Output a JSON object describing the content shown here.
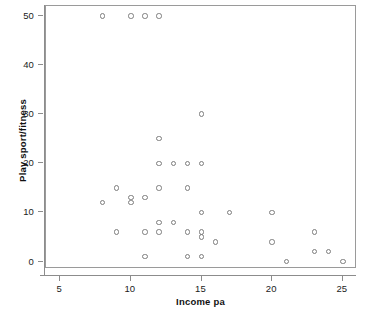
{
  "chart_data": {
    "type": "scatter",
    "title": "",
    "xlabel": "Income pa",
    "ylabel": "Play sport/fitness",
    "xlim": [
      4,
      26
    ],
    "ylim": [
      -1.5,
      52
    ],
    "xticks": [
      5,
      10,
      15,
      20,
      25
    ],
    "yticks": [
      0,
      10,
      20,
      30,
      40,
      50
    ],
    "xtick_labels": [
      "5",
      "10",
      "15",
      "20",
      "25"
    ],
    "ytick_labels": [
      "0",
      "10",
      "20",
      "30",
      "40",
      "50"
    ],
    "grid": false,
    "legend": null,
    "marker": "open-circle",
    "marker_color": "#7d7d7d",
    "frame_color": "#9a9a9a",
    "points": [
      {
        "x": 8,
        "y": 50
      },
      {
        "x": 10,
        "y": 50
      },
      {
        "x": 11,
        "y": 50
      },
      {
        "x": 12,
        "y": 50
      },
      {
        "x": 15,
        "y": 30
      },
      {
        "x": 12,
        "y": 25
      },
      {
        "x": 12,
        "y": 20
      },
      {
        "x": 13,
        "y": 20
      },
      {
        "x": 14,
        "y": 20
      },
      {
        "x": 15,
        "y": 20
      },
      {
        "x": 9,
        "y": 15
      },
      {
        "x": 12,
        "y": 15
      },
      {
        "x": 14,
        "y": 15
      },
      {
        "x": 10,
        "y": 13
      },
      {
        "x": 11,
        "y": 13
      },
      {
        "x": 8,
        "y": 12
      },
      {
        "x": 10,
        "y": 12
      },
      {
        "x": 15,
        "y": 10
      },
      {
        "x": 17,
        "y": 10
      },
      {
        "x": 20,
        "y": 10
      },
      {
        "x": 12,
        "y": 8
      },
      {
        "x": 13,
        "y": 8
      },
      {
        "x": 9,
        "y": 6
      },
      {
        "x": 11,
        "y": 6
      },
      {
        "x": 12,
        "y": 6
      },
      {
        "x": 14,
        "y": 6
      },
      {
        "x": 15,
        "y": 6
      },
      {
        "x": 23,
        "y": 6
      },
      {
        "x": 15,
        "y": 5
      },
      {
        "x": 16,
        "y": 4
      },
      {
        "x": 20,
        "y": 4
      },
      {
        "x": 23,
        "y": 2
      },
      {
        "x": 24,
        "y": 2
      },
      {
        "x": 11,
        "y": 1
      },
      {
        "x": 14,
        "y": 1
      },
      {
        "x": 15,
        "y": 1
      },
      {
        "x": 21,
        "y": 0
      },
      {
        "x": 25,
        "y": 0
      }
    ]
  }
}
